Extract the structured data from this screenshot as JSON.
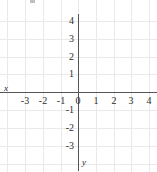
{
  "figure": {
    "kind": "coordinate-plane",
    "width": 157,
    "height": 172,
    "background_color": "#ffffff",
    "grid_color": "#e9e9e9",
    "axis_color": "#555555",
    "label_color": "#2b2b2b"
  },
  "chart_data": {
    "type": "scatter",
    "title": "",
    "subtitle": "",
    "xlabel": "x",
    "ylabel": "y",
    "xlim": [
      -3.9,
      4.4
    ],
    "ylim": [
      -3.6,
      4.4
    ],
    "xticks": [
      -3,
      -2,
      -1,
      0,
      1,
      2,
      3,
      4
    ],
    "yticks": [
      4,
      3,
      2,
      1,
      0,
      -1,
      -2,
      -3
    ],
    "xtick_labels": [
      "-3",
      "-2",
      "-1",
      "0",
      "1",
      "2",
      "3",
      "4"
    ],
    "ytick_labels": [
      "4",
      "3",
      "2",
      "1",
      "0",
      "-1",
      "-2",
      "-3"
    ],
    "grid": true,
    "legend": null,
    "series": [],
    "x": [],
    "values": [],
    "annotations": []
  },
  "axes": {
    "x_axis_label": "x",
    "y_axis_label": "y"
  },
  "ticks": {
    "x": [
      {
        "label": "-3",
        "px": 25
      },
      {
        "label": "-2",
        "px": 43
      },
      {
        "label": "-1",
        "px": 61
      },
      {
        "label": "0",
        "px": 78
      },
      {
        "label": "1",
        "px": 96
      },
      {
        "label": "2",
        "px": 114
      },
      {
        "label": "3",
        "px": 131
      },
      {
        "label": "4",
        "px": 149
      }
    ],
    "y": [
      {
        "label": "4",
        "px": 21
      },
      {
        "label": "3",
        "px": 39
      },
      {
        "label": "2",
        "px": 57
      },
      {
        "label": "1",
        "px": 74
      },
      {
        "label": "0",
        "px": 92
      },
      {
        "label": "-1",
        "px": 110
      },
      {
        "label": "-2",
        "px": 128
      },
      {
        "label": "-3",
        "px": 146
      }
    ]
  }
}
